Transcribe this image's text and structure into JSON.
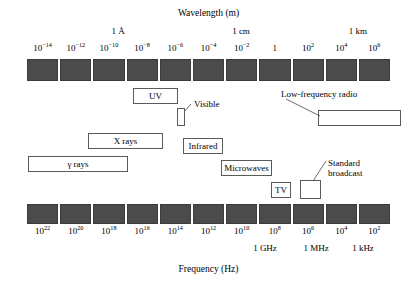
{
  "chart_data": {
    "type": "diagram",
    "top_axis": {
      "label": "Wavelength (m)",
      "tick_labels": [
        "10−14",
        "10−12",
        "10−10",
        "10−8",
        "10−6",
        "10−4",
        "10−2",
        "1",
        "10²",
        "10⁴",
        "10⁶"
      ],
      "tick_mantissas": [
        "10",
        "10",
        "10",
        "10",
        "10",
        "10",
        "10",
        "1",
        "10",
        "10",
        "10"
      ],
      "tick_exponents": [
        "-14",
        "-12",
        "-10",
        "-8",
        "-6",
        "-4",
        "-2",
        "",
        "2",
        "4",
        "6"
      ],
      "named_marks": [
        {
          "label": "1 Å",
          "value": -10
        },
        {
          "label": "1 cm",
          "value": -2
        },
        {
          "label": "1 km",
          "value": 3
        }
      ]
    },
    "bottom_axis": {
      "label": "Frequency (Hz)",
      "tick_labels": [
        "10²²",
        "10²⁰",
        "10¹⁸",
        "10¹⁶",
        "10¹⁴",
        "10¹²",
        "10¹⁰",
        "10⁸",
        "10⁶",
        "10⁴",
        "10²"
      ],
      "tick_mantissas": [
        "10",
        "10",
        "10",
        "10",
        "10",
        "10",
        "10",
        "10",
        "10",
        "10",
        "10"
      ],
      "tick_exponents": [
        "22",
        "20",
        "18",
        "16",
        "14",
        "12",
        "10",
        "8",
        "6",
        "4",
        "2"
      ],
      "named_marks": [
        {
          "label": "1 GHz",
          "value": 9
        },
        {
          "label": "1 MHz",
          "value": 6
        },
        {
          "label": "1 kHz",
          "value": 3
        }
      ]
    },
    "bands": [
      {
        "name": "gamma-rays",
        "label": "γ rays"
      },
      {
        "name": "x-rays",
        "label": "X rays"
      },
      {
        "name": "ultraviolet",
        "label": "UV"
      },
      {
        "name": "visible",
        "label": "Visible"
      },
      {
        "name": "infrared",
        "label": "Infrared"
      },
      {
        "name": "microwaves",
        "label": "Microwaves"
      },
      {
        "name": "television",
        "label": "TV"
      },
      {
        "name": "standard-broadcast",
        "label": "Standard\nbroadcast"
      },
      {
        "name": "low-frequency-radio",
        "label": "Low-frequency radio"
      }
    ],
    "segment_count": 11,
    "colors": {
      "segment_fill": "#4b4b4b",
      "segment_border": "#3c3c3c",
      "box_border": "#5a5a5a",
      "background": "#ffffff",
      "text": "#000000"
    }
  },
  "top_axis_title": "Wavelength (m)",
  "bottom_axis_title": "Frequency (Hz)",
  "top_ticks": [
    {
      "m": "10",
      "e": "−14"
    },
    {
      "m": "10",
      "e": "−12"
    },
    {
      "m": "10",
      "e": "−10"
    },
    {
      "m": "10",
      "e": "−8"
    },
    {
      "m": "10",
      "e": "−6"
    },
    {
      "m": "10",
      "e": "−4"
    },
    {
      "m": "10",
      "e": "−2"
    },
    {
      "m": "1",
      "e": ""
    },
    {
      "m": "10",
      "e": "2"
    },
    {
      "m": "10",
      "e": "4"
    },
    {
      "m": "10",
      "e": "6"
    }
  ],
  "bottom_ticks": [
    {
      "m": "10",
      "e": "22"
    },
    {
      "m": "10",
      "e": "20"
    },
    {
      "m": "10",
      "e": "18"
    },
    {
      "m": "10",
      "e": "16"
    },
    {
      "m": "10",
      "e": "14"
    },
    {
      "m": "10",
      "e": "12"
    },
    {
      "m": "10",
      "e": "10"
    },
    {
      "m": "10",
      "e": "8"
    },
    {
      "m": "10",
      "e": "6"
    },
    {
      "m": "10",
      "e": "4"
    },
    {
      "m": "10",
      "e": "2"
    }
  ],
  "top_named": [
    {
      "label": "1 Å"
    },
    {
      "label": "1 cm"
    },
    {
      "label": "1 km"
    }
  ],
  "bottom_named": [
    {
      "label": "1 GHz"
    },
    {
      "label": "1 MHz"
    },
    {
      "label": "1 kHz"
    }
  ],
  "boxes": {
    "uv": "UV",
    "xrays": "X rays",
    "gammarays": "γ rays",
    "infrared": "Infrared",
    "microwaves": "Microwaves",
    "tv": "TV",
    "visible": "",
    "lowfreq": "",
    "standard": ""
  },
  "leader_labels": {
    "visible": "Visible",
    "lowfreq_radio": "Low-frequency radio",
    "standard_line1": "Standard",
    "standard_line2": "broadcast"
  }
}
